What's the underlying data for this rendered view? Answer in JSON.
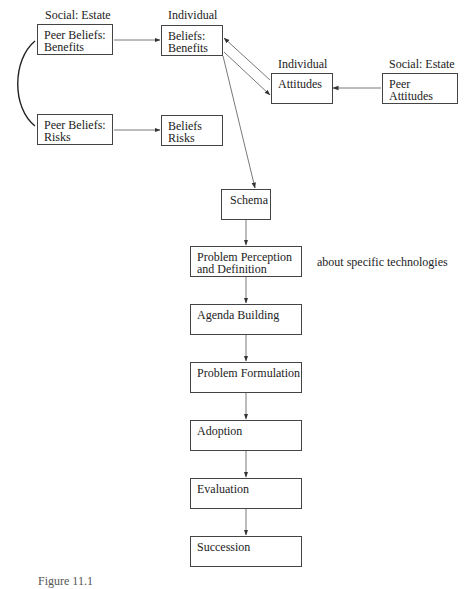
{
  "diagram": {
    "labels": {
      "social_estate_1": "Social: Estate",
      "individual_1": "Individual",
      "individual_2": "Individual",
      "social_estate_2": "Social: Estate",
      "note_technologies": "about specific technologies"
    },
    "nodes": {
      "peer_beliefs_benefits": [
        "Peer Beliefs:",
        "Benefits"
      ],
      "peer_beliefs_risks": [
        "Peer Beliefs:",
        "Risks"
      ],
      "beliefs_benefits": [
        "Beliefs:",
        "Benefits"
      ],
      "beliefs_risks": [
        "Beliefs",
        "Risks"
      ],
      "attitudes": [
        "Attitudes"
      ],
      "peer_attitudes": [
        "Peer",
        "Attitudes"
      ],
      "schema": [
        "Schema"
      ],
      "problem_perception": [
        "Problem Perception",
        "and Definition"
      ],
      "agenda_building": [
        "Agenda Building"
      ],
      "problem_formulation": [
        "Problem Formulation"
      ],
      "adoption": [
        "Adoption"
      ],
      "evaluation": [
        "Evaluation"
      ],
      "succession": [
        "Succession"
      ]
    },
    "edges": [
      {
        "from": "peer_beliefs_benefits",
        "to": "beliefs_benefits"
      },
      {
        "from": "peer_beliefs_risks",
        "to": "beliefs_risks"
      },
      {
        "from": "peer_beliefs_benefits",
        "to": "peer_beliefs_risks",
        "style": "curve"
      },
      {
        "from": "attitudes",
        "to": "beliefs_benefits"
      },
      {
        "from": "beliefs_benefits",
        "to": "attitudes"
      },
      {
        "from": "peer_attitudes",
        "to": "attitudes"
      },
      {
        "from": "beliefs_benefits",
        "to": "schema"
      },
      {
        "from": "schema",
        "to": "problem_perception"
      },
      {
        "from": "problem_perception",
        "to": "agenda_building"
      },
      {
        "from": "agenda_building",
        "to": "problem_formulation"
      },
      {
        "from": "problem_formulation",
        "to": "adoption"
      },
      {
        "from": "adoption",
        "to": "evaluation"
      },
      {
        "from": "evaluation",
        "to": "succession"
      }
    ],
    "caption": "Figure 11.1"
  }
}
